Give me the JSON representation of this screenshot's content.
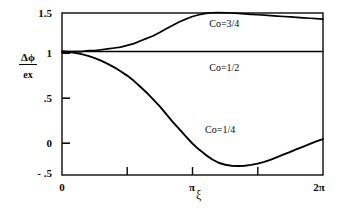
{
  "chart_data": {
    "type": "line",
    "title": "",
    "xlabel": "ξ",
    "ylabel": "Δφ / ex",
    "ylabel_numerator": "Δϕ",
    "ylabel_denominator": "ex",
    "xlim": [
      0,
      6.2832
    ],
    "ylim": [
      -0.41,
      1.44
    ],
    "grid": false,
    "legend_position": "inline-annotations",
    "x_tick_labels": [
      "0",
      "π",
      "2π"
    ],
    "x_tick_values": [
      0,
      3.1416,
      6.2832
    ],
    "x_minor_tick_values": [
      1.5708,
      4.7124
    ],
    "y_tick_labels": [
      "1.5",
      "1",
      ".5",
      "0",
      "- .5"
    ],
    "y_tick_values": [
      1.5,
      1.0,
      0.5,
      0.0,
      -0.5
    ],
    "series": [
      {
        "name": "Co=3/4",
        "label": "Co=3/4",
        "label_x": 4.05,
        "label_y": 1.31,
        "color": "#000000",
        "x": [
          0,
          0.16,
          0.31,
          0.47,
          0.63,
          0.79,
          0.94,
          1.1,
          1.26,
          1.41,
          1.57,
          1.73,
          1.88,
          2.04,
          2.2,
          2.36,
          2.51,
          2.67,
          2.83,
          2.98,
          3.14,
          3.3,
          3.46,
          3.61,
          3.77,
          3.93,
          4.08,
          4.24,
          4.4,
          4.55,
          4.71,
          4.87,
          5.03,
          5.18,
          5.34,
          5.5,
          5.65,
          5.81,
          5.97,
          6.12,
          6.28
        ],
        "y": [
          1.0,
          1.0,
          1.0,
          1.0,
          1.01,
          1.01,
          1.02,
          1.03,
          1.04,
          1.05,
          1.07,
          1.09,
          1.12,
          1.15,
          1.18,
          1.22,
          1.26,
          1.3,
          1.34,
          1.37,
          1.4,
          1.42,
          1.435,
          1.443,
          1.445,
          1.443,
          1.44,
          1.435,
          1.43,
          1.425,
          1.42,
          1.415,
          1.41,
          1.405,
          1.4,
          1.395,
          1.39,
          1.385,
          1.38,
          1.375,
          1.37
        ]
      },
      {
        "name": "Co=1/2",
        "label": "Co=1/2",
        "label_x": 4.05,
        "label_y": 0.81,
        "color": "#000000",
        "x": [
          0,
          6.28
        ],
        "y": [
          1.0,
          1.0
        ]
      },
      {
        "name": "Co=1/4",
        "label": "Co=1/4",
        "label_x": 3.95,
        "label_y": 0.1,
        "color": "#000000",
        "x": [
          0,
          0.16,
          0.31,
          0.47,
          0.63,
          0.79,
          0.94,
          1.1,
          1.26,
          1.41,
          1.57,
          1.73,
          1.88,
          2.04,
          2.2,
          2.36,
          2.51,
          2.67,
          2.83,
          2.98,
          3.14,
          3.3,
          3.46,
          3.61,
          3.77,
          3.93,
          4.08,
          4.24,
          4.4,
          4.55,
          4.71,
          4.87,
          5.03,
          5.18,
          5.34,
          5.5,
          5.65,
          5.81,
          5.97,
          6.12,
          6.28
        ],
        "y": [
          1.0,
          0.995,
          0.985,
          0.97,
          0.95,
          0.925,
          0.895,
          0.86,
          0.82,
          0.775,
          0.725,
          0.665,
          0.6,
          0.53,
          0.45,
          0.37,
          0.285,
          0.195,
          0.11,
          0.03,
          -0.05,
          -0.12,
          -0.18,
          -0.23,
          -0.27,
          -0.293,
          -0.305,
          -0.308,
          -0.305,
          -0.295,
          -0.28,
          -0.26,
          -0.235,
          -0.205,
          -0.175,
          -0.145,
          -0.115,
          -0.085,
          -0.055,
          -0.027,
          0.0
        ]
      }
    ]
  },
  "axes": {
    "x_ticks": [
      {
        "label": "0",
        "value": 0
      },
      {
        "label": "π",
        "value": 3.1416
      },
      {
        "label": "2π",
        "value": 6.2832
      }
    ],
    "y_ticks": [
      {
        "label": "1.5",
        "value": 1.5
      },
      {
        "label": "1",
        "value": 1.0
      },
      {
        "label": ".5",
        "value": 0.5
      },
      {
        "label": "0",
        "value": 0.0
      },
      {
        "label": "- .5",
        "value": -0.5
      }
    ],
    "x_axis_label": "ξ",
    "y_axis_label_numerator": "Δϕ",
    "y_axis_label_denominator": "ex"
  }
}
